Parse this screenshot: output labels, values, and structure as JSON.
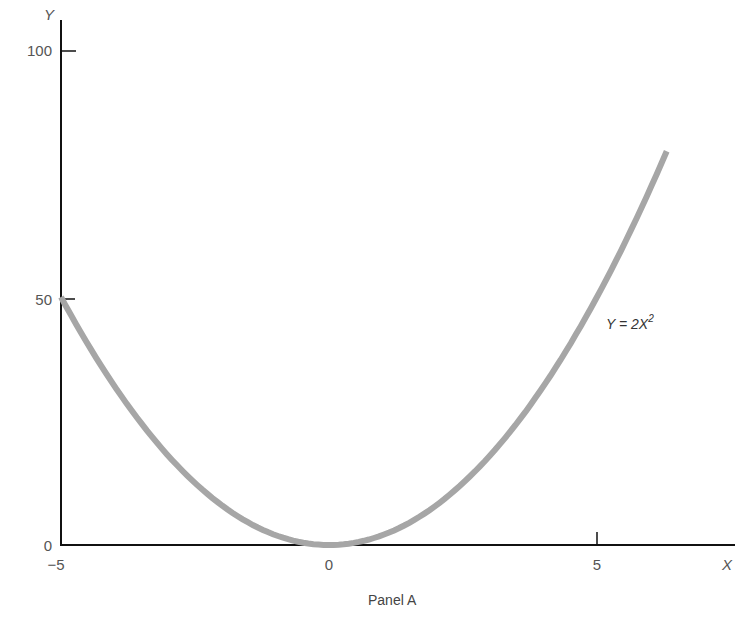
{
  "chart_data": {
    "type": "line",
    "title": "",
    "caption": "Panel A",
    "xlabel": "X",
    "ylabel": "Y",
    "xlim": [
      -5,
      7.6
    ],
    "ylim": [
      0,
      105
    ],
    "x_ticks": [
      -5,
      0,
      5
    ],
    "x_tick_labels": [
      "−5",
      "0",
      "5"
    ],
    "y_ticks": [
      0,
      50,
      100
    ],
    "y_tick_labels": [
      "0",
      "50",
      "100"
    ],
    "grid": false,
    "legend": null,
    "series": [
      {
        "name": "Y = 2X^2",
        "equation": "Y = 2X²",
        "color": "#a6a6a6",
        "x": [
          -5,
          -4,
          -3,
          -2,
          -1,
          0,
          1,
          2,
          3,
          4,
          5,
          6,
          6.3
        ],
        "y": [
          50,
          32,
          18,
          8,
          2,
          0,
          2,
          8,
          18,
          32,
          50,
          72,
          79.4
        ]
      }
    ],
    "annotations": [
      {
        "text": "Y = 2X²",
        "x": 5.1,
        "y": 50
      }
    ]
  },
  "labels": {
    "x_axis": "X",
    "y_axis": "Y",
    "caption": "Panel A",
    "equation_main": "Y = 2X",
    "equation_sup": "2",
    "x_ticks": [
      "−5",
      "0",
      "5"
    ],
    "y_ticks": [
      "0",
      "50",
      "100"
    ]
  },
  "colors": {
    "axis": "#111111",
    "curve": "#a6a6a6",
    "text": "#555555"
  }
}
